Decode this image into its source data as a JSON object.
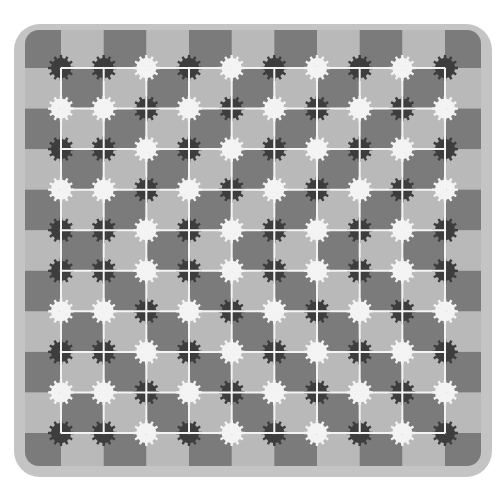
{
  "canvas": {
    "width": 504,
    "height": 483,
    "background": "#ffffff"
  },
  "frame": {
    "x": 14,
    "y": 24,
    "width": 478,
    "height": 453,
    "radius": 26,
    "color": "#c4c4c4"
  },
  "board": {
    "x0": 25,
    "y0": 30,
    "x1": 481,
    "y1": 466,
    "corner_radius": 14,
    "dark_square_color": "#7b7b7b",
    "light_square_color": "#b9b9b9",
    "checker_rule": "dark when (row + col) is even; row 0 and col 0 are the partial edge cells"
  },
  "grid": {
    "columns_x": [
      61,
      103.7,
      146.3,
      189,
      231.7,
      274.3,
      317,
      359.7,
      402.3,
      445
    ],
    "rows_y": [
      68,
      108.6,
      149.1,
      189.7,
      230.2,
      270.8,
      311.3,
      351.9,
      392.4,
      433
    ],
    "line_color": "#f4f4f4",
    "line_width": 2
  },
  "gears": {
    "teeth": 12,
    "outer_radius": 13,
    "inner_radius": 10,
    "hole_radius": 1.6,
    "dark_color": "#3d3d3d",
    "light_color": "#f3f3f3",
    "legend": {
      "D": "dark-gear",
      "W": "white-gear"
    },
    "matrix": [
      [
        "D",
        "D",
        "W",
        "D",
        "W",
        "D",
        "W",
        "D",
        "W",
        "D"
      ],
      [
        "W",
        "W",
        "D",
        "W",
        "D",
        "W",
        "D",
        "W",
        "D",
        "W"
      ],
      [
        "D",
        "D",
        "W",
        "D",
        "W",
        "D",
        "W",
        "D",
        "W",
        "D"
      ],
      [
        "W",
        "W",
        "D",
        "W",
        "D",
        "W",
        "D",
        "W",
        "D",
        "W"
      ],
      [
        "D",
        "D",
        "W",
        "D",
        "W",
        "D",
        "W",
        "D",
        "W",
        "D"
      ],
      [
        "D",
        "D",
        "W",
        "D",
        "W",
        "D",
        "W",
        "D",
        "W",
        "D"
      ],
      [
        "W",
        "W",
        "D",
        "W",
        "D",
        "W",
        "D",
        "W",
        "D",
        "W"
      ],
      [
        "D",
        "D",
        "W",
        "D",
        "W",
        "D",
        "W",
        "D",
        "W",
        "D"
      ],
      [
        "W",
        "W",
        "D",
        "W",
        "D",
        "W",
        "D",
        "W",
        "D",
        "W"
      ],
      [
        "D",
        "D",
        "W",
        "D",
        "W",
        "D",
        "W",
        "D",
        "W",
        "D"
      ]
    ]
  }
}
